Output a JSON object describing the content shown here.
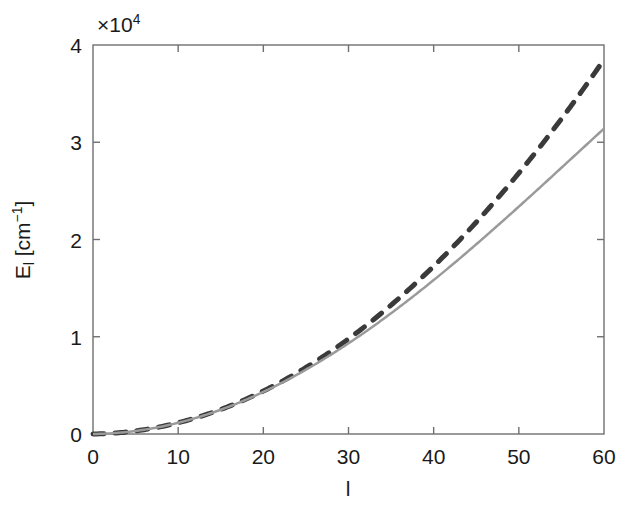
{
  "chart_data": {
    "type": "line",
    "title": "",
    "subtitle": "",
    "xlabel": "l",
    "ylabel": "E_l [cm^-1]",
    "ylabel_base": "E",
    "ylabel_sub": "l",
    "ylabel_unit_open": " [cm",
    "ylabel_unit_exp": "−1",
    "ylabel_unit_close": "]",
    "y_exponent_label": "×10",
    "y_exponent_power": "4",
    "y_scale_factor": 10000,
    "xlim": [
      0,
      60
    ],
    "ylim": [
      0,
      40000
    ],
    "grid": false,
    "legend_position": "none",
    "xticks": [
      0,
      10,
      20,
      30,
      40,
      50,
      60
    ],
    "xtick_labels": [
      "0",
      "10",
      "20",
      "30",
      "40",
      "50",
      "60"
    ],
    "yticks": [
      0,
      10000,
      20000,
      30000,
      40000
    ],
    "ytick_labels": [
      "0",
      "1",
      "2",
      "3",
      "4"
    ],
    "tick_direction": "in",
    "frame": "box",
    "series": [
      {
        "name": "rigid-rotor",
        "style": "dashed",
        "color": "#3a3a3a",
        "linewidth": 5,
        "dash_pattern": "11 11",
        "formula": "B*l*(l+1)",
        "B": 10.52,
        "x": [
          0,
          2,
          4,
          6,
          8,
          10,
          12,
          14,
          16,
          18,
          20,
          22,
          24,
          26,
          28,
          30,
          32,
          34,
          36,
          38,
          40,
          42,
          44,
          46,
          48,
          50,
          52,
          54,
          56,
          58,
          60
        ],
        "values": [
          0,
          63,
          210,
          442,
          758,
          1157,
          1641,
          2209,
          2861,
          3597,
          4418,
          5323,
          6312,
          7385,
          8542,
          9784,
          11110,
          12520,
          14014,
          15592,
          17255,
          19001,
          20832,
          22747,
          24746,
          26830,
          28998,
          31250,
          33587,
          36008,
          38513
        ]
      },
      {
        "name": "non-rigid-rotor",
        "style": "solid",
        "color": "#9a9a9a",
        "linewidth": 2.5,
        "formula": "B*l*(l+1) - D*l^2*(l+1)^2",
        "B": 10.52,
        "D": 0.00053,
        "x": [
          0,
          2,
          4,
          6,
          8,
          10,
          12,
          14,
          16,
          18,
          20,
          22,
          24,
          26,
          28,
          30,
          32,
          34,
          36,
          38,
          40,
          42,
          44,
          46,
          48,
          50,
          52,
          54,
          56,
          58,
          60
        ],
        "values": [
          0,
          63,
          210,
          441,
          755,
          1151,
          1628,
          2185,
          2820,
          3532,
          4318,
          5176,
          6104,
          7098,
          8156,
          9274,
          10447,
          11672,
          12942,
          14253,
          15598,
          16970,
          18361,
          19763,
          21167,
          22563,
          23941,
          25288,
          26592,
          27839,
          29014
        ]
      }
    ],
    "annotations": []
  }
}
